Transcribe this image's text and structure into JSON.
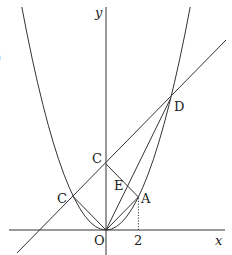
{
  "figure": {
    "axes": {
      "x_label": "x",
      "y_label": "y",
      "origin_label": "O",
      "x_tick_label": "2"
    },
    "curve": {
      "type": "parabola",
      "equation": "y = x^2/2"
    },
    "points": [
      {
        "name": "O",
        "label": "O",
        "x": 0,
        "y": 0
      },
      {
        "name": "A",
        "label": "A",
        "x": 2,
        "y": 2
      },
      {
        "name": "B",
        "label": "B",
        "x": 0,
        "y": 4
      },
      {
        "name": "C",
        "label": "C",
        "x": -2,
        "y": 2
      },
      {
        "name": "D",
        "label": "D",
        "x": 4,
        "y": 8
      },
      {
        "name": "E",
        "label": "E",
        "x": 1.333,
        "y": 2.667
      }
    ],
    "segments": [
      "OA",
      "OC",
      "OD",
      "AB",
      "OB"
    ],
    "lines": [
      "line BD through C"
    ],
    "guides": [
      "dotted vertical from A to x-axis at x = 2"
    ],
    "edge_fragment": ")"
  }
}
